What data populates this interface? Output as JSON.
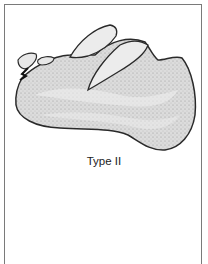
{
  "figure": {
    "caption": "Type II",
    "colors": {
      "outline": "#2a2a2a",
      "fill": "#d8d8d8",
      "tooth_fill": "#ececec",
      "frame": "#7a7a7a"
    }
  }
}
